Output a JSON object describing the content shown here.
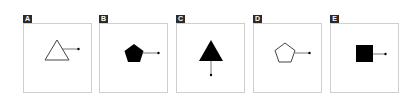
{
  "options": [
    {
      "label": "A",
      "shape": "triangle",
      "fill": "outline",
      "arrow_direction": "right"
    },
    {
      "label": "B",
      "shape": "pentagon",
      "fill": "solid",
      "arrow_direction": "right"
    },
    {
      "label": "C",
      "shape": "triangle",
      "fill": "solid",
      "arrow_direction": "down"
    },
    {
      "label": "D",
      "shape": "pentagon",
      "fill": "outline",
      "arrow_direction": "right"
    },
    {
      "label": "E",
      "shape": "square",
      "fill": "solid",
      "arrow_direction": "right"
    }
  ],
  "colors": {
    "label_bg": "#2b2b2b",
    "label_text": "#ffffff",
    "border": "#cfcfcf",
    "shape": "#000000",
    "outline": "#444444"
  }
}
